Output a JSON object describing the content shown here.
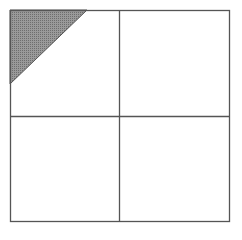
{
  "diagram": {
    "type": "grid-square-with-shaded-triangle",
    "grid": {
      "rows": 2,
      "cols": 2
    },
    "square": {
      "x": 10,
      "y": 10,
      "width": 219,
      "height": 211
    },
    "dividers": {
      "vertical_x": 119,
      "horizontal_y": 116
    },
    "shaded_triangle": {
      "points": "10,10 87,10 10,84"
    },
    "colors": {
      "line": "#555555",
      "shade": "#8a8a8a",
      "background": "#ffffff"
    }
  }
}
